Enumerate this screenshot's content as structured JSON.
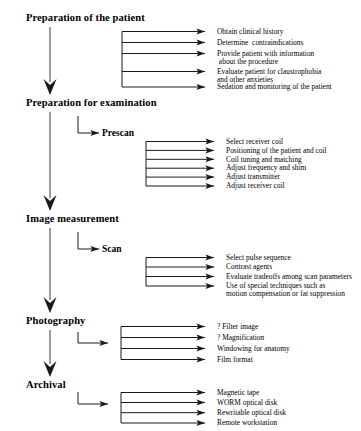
{
  "diagram": {
    "line_color": "#1a1a1a",
    "text_color": "#000000",
    "background": "#ffffff",
    "stages": [
      {
        "label": "Preparation of the patient",
        "sub_label": null,
        "tasks": [
          "Obtain clinical history",
          "Determine  contraindications",
          "Provide patient with information\n about the procedure",
          "Evaluate patient for claustrophobia\nand other anxieties",
          "Sedation and monitoring of the patient"
        ]
      },
      {
        "label": "Preparation for examination",
        "sub_label": "Prescan",
        "tasks": [
          "Select receiver coil",
          "Positioning of the patient and coil",
          "Coil tuning and matching",
          "Adjust frequency and shim",
          "Adjust transmitter",
          "Adjust receiver coil"
        ]
      },
      {
        "label": "Image measurement",
        "sub_label": "Scan",
        "tasks": [
          "Select pulse sequence",
          "Contrast agents",
          "Evaluate tradeoffs among scan parameters",
          "Use of special techniques such as\nmotion compensation or fat suppression"
        ]
      },
      {
        "label": "Photography",
        "sub_label": null,
        "tasks": [
          "? Filter image",
          "? Magnification",
          "Windowing for anatomy",
          "Film format"
        ]
      },
      {
        "label": "Archival",
        "sub_label": null,
        "tasks": [
          "Magnetic tape",
          "WORM optical disk",
          "Rewritable optical disk",
          "Remote workstation"
        ]
      }
    ]
  }
}
